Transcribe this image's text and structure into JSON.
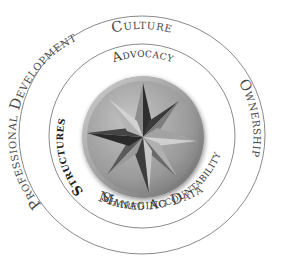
{
  "diagram": {
    "colors": {
      "ring_line": "#8a8a8a",
      "outer_text": "#4a4a4a",
      "inner_text": "#3c3c3c",
      "emphasis_text": "#1e1e1e",
      "medallion_light": "#b8b8b8",
      "medallion_mid": "#8f8f8f",
      "medallion_dark": "#3a3a3a",
      "background": "#ffffff"
    },
    "outer_ring": {
      "labels": [
        {
          "id": "culture",
          "text": "Culture"
        },
        {
          "id": "ownership",
          "text": "Ownership"
        },
        {
          "id": "managing-data",
          "text": "Managing Data"
        },
        {
          "id": "professional-development",
          "text": "Professional Development"
        }
      ]
    },
    "inner_ring": {
      "labels": [
        {
          "id": "advocacy",
          "text": "Advocacy"
        },
        {
          "id": "shared-accountability",
          "text": "Shared Accountability"
        },
        {
          "id": "structures",
          "text": "Structures"
        }
      ]
    },
    "center": {
      "icon": "compass-star-icon"
    }
  }
}
